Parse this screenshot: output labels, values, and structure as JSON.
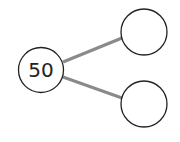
{
  "diagram": {
    "type": "number-bond",
    "whole": {
      "label": "50"
    },
    "parts": [
      {
        "label": ""
      },
      {
        "label": ""
      }
    ],
    "colors": {
      "stroke": "#222222",
      "connector": "#8a8a8a",
      "background": "#ffffff"
    }
  }
}
